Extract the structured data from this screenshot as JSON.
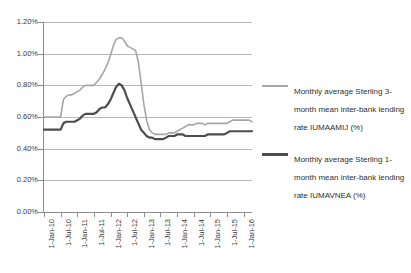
{
  "chart_data": {
    "type": "line",
    "title": "",
    "xlabel": "",
    "ylabel": "",
    "ylim": [
      0.0,
      1.2
    ],
    "ytick_values": [
      0.0,
      0.2,
      0.4,
      0.6,
      0.8,
      1.0,
      1.2
    ],
    "ytick_labels": [
      "0.00%",
      "0.20%",
      "0.40%",
      "0.60%",
      "0.80%",
      "1.00%",
      "1.20%"
    ],
    "grid": true,
    "legend_position": "right",
    "xtick_labels": [
      "1-Jan-10",
      "1-Jul-10",
      "1-Jan-11",
      "1-Jul-11",
      "1-Jan-12",
      "1-Jul-12",
      "1-Jan-13",
      "1-Jul-13",
      "1-Jan-14",
      "1-Jul-14",
      "1-Jan-15",
      "1-Jul-15",
      "1-Jan-16"
    ],
    "x_count": 76,
    "series": [
      {
        "name": "Monthly average Sterling 3-month mean inter-bank lending rate IUMAAMIJ (%)",
        "short_name": "IUMAAMIJ",
        "color": "#a6a6a6",
        "width": 1.6,
        "values": [
          0.6,
          0.6,
          0.6,
          0.6,
          0.6,
          0.6,
          0.6,
          0.71,
          0.73,
          0.74,
          0.74,
          0.75,
          0.76,
          0.77,
          0.79,
          0.8,
          0.8,
          0.8,
          0.8,
          0.82,
          0.84,
          0.87,
          0.9,
          0.94,
          0.99,
          1.05,
          1.09,
          1.1,
          1.1,
          1.08,
          1.05,
          1.04,
          1.03,
          1.02,
          0.95,
          0.82,
          0.68,
          0.58,
          0.52,
          0.5,
          0.49,
          0.49,
          0.49,
          0.49,
          0.49,
          0.5,
          0.5,
          0.5,
          0.51,
          0.52,
          0.53,
          0.54,
          0.55,
          0.55,
          0.55,
          0.56,
          0.56,
          0.56,
          0.55,
          0.56,
          0.56,
          0.56,
          0.56,
          0.56,
          0.56,
          0.56,
          0.56,
          0.57,
          0.58,
          0.58,
          0.58,
          0.58,
          0.58,
          0.58,
          0.58,
          0.57
        ]
      },
      {
        "name": "Monthly average Sterling 1-month mean inter-bank lending rate IUMAVNEA (%)",
        "short_name": "IUMAVNEA",
        "color": "#4d4d4d",
        "width": 2.2,
        "values": [
          0.52,
          0.52,
          0.52,
          0.52,
          0.52,
          0.52,
          0.52,
          0.56,
          0.57,
          0.57,
          0.57,
          0.57,
          0.58,
          0.59,
          0.61,
          0.62,
          0.62,
          0.62,
          0.62,
          0.63,
          0.65,
          0.66,
          0.66,
          0.68,
          0.71,
          0.75,
          0.79,
          0.81,
          0.8,
          0.77,
          0.72,
          0.68,
          0.64,
          0.6,
          0.56,
          0.52,
          0.5,
          0.48,
          0.47,
          0.47,
          0.46,
          0.46,
          0.46,
          0.46,
          0.47,
          0.48,
          0.48,
          0.48,
          0.49,
          0.49,
          0.49,
          0.48,
          0.48,
          0.48,
          0.48,
          0.48,
          0.48,
          0.48,
          0.48,
          0.49,
          0.49,
          0.49,
          0.49,
          0.49,
          0.49,
          0.49,
          0.5,
          0.51,
          0.51,
          0.51,
          0.51,
          0.51,
          0.51,
          0.51,
          0.51,
          0.51
        ]
      }
    ]
  },
  "legend": {
    "items": [
      {
        "label": "Monthly average Sterling 3-month mean inter-bank lending rate IUMAAMIJ (%)",
        "color": "#a6a6a6"
      },
      {
        "label": "Monthly average Sterling 1-month mean inter-bank lending rate IUMAVNEA (%)",
        "color": "#4d4d4d"
      }
    ]
  }
}
